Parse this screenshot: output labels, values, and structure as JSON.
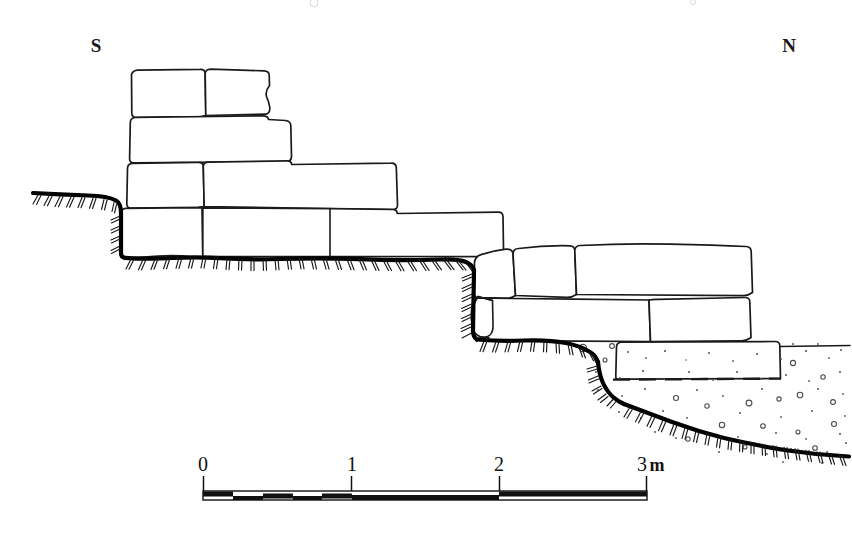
{
  "figure": {
    "type": "archaeological-section-drawing",
    "width": 852,
    "height": 533,
    "background_color": "#ffffff",
    "ink_color": "#1a1a1a"
  },
  "orientation": {
    "left_label": "S",
    "right_label": "N",
    "left_label_x": 96,
    "left_label_y": 52,
    "right_label_x": 789,
    "right_label_y": 52
  },
  "scale": {
    "unit_label": "m",
    "unit_label_full": "3 m",
    "tick_labels": [
      "0",
      "1",
      "2",
      "3"
    ],
    "tick_values": [
      0,
      1,
      2,
      3
    ],
    "tick_x_px": [
      203,
      352,
      499,
      647
    ],
    "bar_y_px": 491,
    "bar_height_px": 9,
    "subdivision_count_first_metre": 5,
    "subdivision_length_m": 0.2,
    "pixels_per_metre": 148,
    "segments": [
      {
        "from_m": 0.0,
        "to_m": 0.2,
        "filled": true
      },
      {
        "from_m": 0.2,
        "to_m": 0.4,
        "filled": false
      },
      {
        "from_m": 0.4,
        "to_m": 0.6,
        "filled": true
      },
      {
        "from_m": 0.6,
        "to_m": 0.8,
        "filled": false
      },
      {
        "from_m": 0.8,
        "to_m": 1.0,
        "filled": true
      },
      {
        "from_m": 1.0,
        "to_m": 2.0,
        "filled": true
      },
      {
        "from_m": 2.0,
        "to_m": 3.0,
        "filled": true
      }
    ]
  },
  "legend_keys": {
    "ground_surface": "thick-black-line-with-hachures",
    "stone_block": "white-outlined-polygon",
    "gravel_fill": "stippled-dots-and-small-circles",
    "reconstructed_edge": "dashed-line"
  },
  "courses": [
    {
      "id": "course-5-top",
      "label": "uppermost course",
      "stone_count": 2
    },
    {
      "id": "course-4",
      "label": "fourth course",
      "stone_count": 1
    },
    {
      "id": "course-3",
      "label": "third course",
      "stone_count": 2
    },
    {
      "id": "course-2",
      "label": "second course",
      "stone_count": 2
    },
    {
      "id": "course-north-upper",
      "label": "north upper course",
      "stone_count": 3
    },
    {
      "id": "course-north-lower",
      "label": "north lower course",
      "stone_count": 2
    },
    {
      "id": "course-north-basal",
      "label": "north basal block",
      "stone_count": 1
    }
  ],
  "features": {
    "packing_stone_label": "wedge packing stone",
    "gravel_fill_label": "gravel and pebble fill",
    "dashed_edge_label": "inferred block base"
  }
}
